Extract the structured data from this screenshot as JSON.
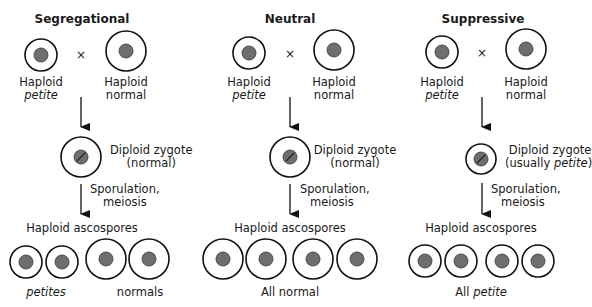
{
  "colors": {
    "outline": "#111111",
    "nucleus": "#6e6e6e",
    "background": "#ffffff"
  },
  "panels": [
    {
      "title": "Segregational",
      "cross_symbol": "×",
      "parent1": {
        "line1": "Haploid",
        "line2": "petite"
      },
      "parent2": {
        "line1": "Haploid",
        "line2": "normal"
      },
      "zygote": {
        "line1": "Diploid zygote",
        "line2": "(normal)"
      },
      "process": {
        "line1": "Sporulation,",
        "line2": "meiosis"
      },
      "spores_label": "Haploid ascospores",
      "outcome": {
        "left": "petites",
        "right": "normals"
      }
    },
    {
      "title": "Neutral",
      "cross_symbol": "×",
      "parent1": {
        "line1": "Haploid",
        "line2": "petite"
      },
      "parent2": {
        "line1": "Haploid",
        "line2": "normal"
      },
      "zygote": {
        "line1": "Diploid zygote",
        "line2": "(normal)"
      },
      "process": {
        "line1": "Sporulation,",
        "line2": "meiosis"
      },
      "spores_label": "Haploid ascospores",
      "outcome": {
        "text": "All normal"
      }
    },
    {
      "title": "Suppressive",
      "cross_symbol": "×",
      "parent1": {
        "line1": "Haploid",
        "line2": "petite"
      },
      "parent2": {
        "line1": "Haploid",
        "line2": "normal"
      },
      "zygote": {
        "line1": "Diploid zygote",
        "line2_prefix": "(usually ",
        "line2_italic": "petite",
        "line2_suffix": ")"
      },
      "process": {
        "line1": "Sporulation,",
        "line2": "meiosis"
      },
      "spores_label": "Haploid ascospores",
      "outcome": {
        "prefix": "All ",
        "italic": "petite"
      }
    }
  ]
}
